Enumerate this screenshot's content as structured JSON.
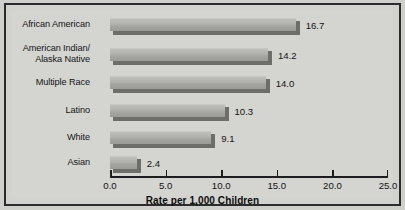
{
  "chart_data": {
    "type": "bar",
    "orientation": "horizontal",
    "title": "",
    "xlabel": "Rate per 1,000 Children",
    "ylabel": "",
    "xlim": [
      0.0,
      25.0
    ],
    "xticks": [
      "0.0",
      "5.0",
      "10.0",
      "15.0",
      "20.0",
      "25.0"
    ],
    "xtick_values": [
      0.0,
      5.0,
      10.0,
      15.0,
      20.0,
      25.0
    ],
    "grid": false,
    "legend": false,
    "categories": [
      "African American",
      "American Indian/\nAlaska Native",
      "Multiple Race",
      "Latino",
      "White",
      "Asian"
    ],
    "values": [
      16.7,
      14.2,
      14.0,
      10.3,
      9.1,
      2.4
    ],
    "value_labels": [
      "16.7",
      "14.2",
      "14.0",
      "10.3",
      "9.1",
      "2.4"
    ],
    "bar_color": "#b0b0ad",
    "bar_shadow_color": "#6d6d6a",
    "background_color": "#d4d4d1",
    "frame_color": "#2b2b2b",
    "text_color": "#141414"
  }
}
